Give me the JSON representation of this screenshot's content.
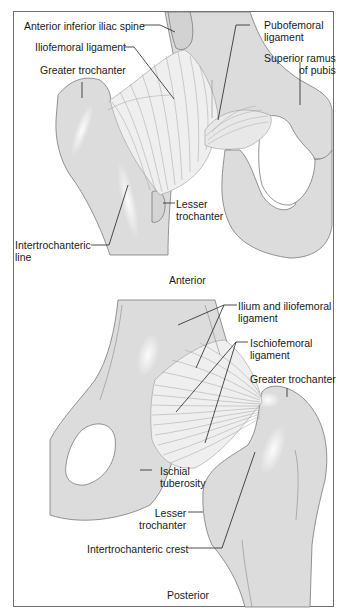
{
  "figure": {
    "colors": {
      "bone_fill": "#dcdcdc",
      "bone_outline": "#7a7a7a",
      "ligament_fill": "#efefef",
      "ligament_fiber": "#9a9a9a",
      "leader_line": "#222222",
      "frame": "#6f6f6f",
      "text": "#1a1a1a"
    },
    "panels": [
      {
        "id": "anterior",
        "caption": "Anterior",
        "labels": [
          {
            "text": "Anterior inferior iliac spine"
          },
          {
            "text": "Pubofemoral",
            "text2": "ligament"
          },
          {
            "text": "Iliofemoral ligament"
          },
          {
            "text": "Superior ramus",
            "text2": "of pubis"
          },
          {
            "text": "Greater trochanter"
          },
          {
            "text": "Lesser",
            "text2": "trochanter"
          },
          {
            "text": "Intertrochanteric",
            "text2": "line"
          }
        ]
      },
      {
        "id": "posterior",
        "caption": "Posterior",
        "labels": [
          {
            "text": "Ilium and iliofemoral",
            "text2": "ligament"
          },
          {
            "text": "Ischiofemoral",
            "text2": "ligament"
          },
          {
            "text": "Greater trochanter"
          },
          {
            "text": "Ischial",
            "text2": "tuberosity"
          },
          {
            "text": "Lesser",
            "text2": "trochanter"
          },
          {
            "text": "Intertrochanteric crest"
          }
        ]
      }
    ]
  }
}
